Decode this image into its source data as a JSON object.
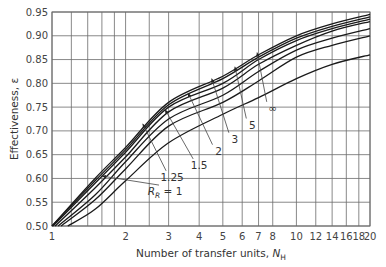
{
  "chart_data": {
    "type": "line",
    "title": "",
    "xlabel": "Number of transfer units, N_H",
    "xlabel_main": "Number of transfer units, ",
    "xlabel_symbol": "N",
    "xlabel_sub": "H",
    "ylabel": "Effectiveness, ε",
    "xscale": "log",
    "xlim": [
      1,
      20
    ],
    "ylim": [
      0.5,
      0.95
    ],
    "grid": true,
    "legend": "inline curve labels with leader arrows",
    "x_ticks": [
      1,
      2,
      3,
      4,
      5,
      6,
      7,
      8,
      10,
      12,
      14,
      16,
      18,
      20
    ],
    "x_tick_labels": [
      "1",
      "2",
      "3",
      "4",
      "5",
      "6",
      "7",
      "8",
      "10",
      "12",
      "14",
      "16",
      "18",
      "20"
    ],
    "x_minor_gridlines": [
      1.2,
      1.4,
      1.6,
      1.8,
      2.5
    ],
    "y_ticks": [
      0.5,
      0.55,
      0.6,
      0.65,
      0.7,
      0.75,
      0.8,
      0.85,
      0.9,
      0.95
    ],
    "y_tick_labels": [
      "0.50",
      "0.55",
      "0.60",
      "0.65",
      "0.70",
      "0.75",
      "0.80",
      "0.85",
      "0.90",
      "0.95"
    ],
    "x": [
      1,
      1.5,
      2,
      3,
      5,
      7,
      10,
      14,
      20
    ],
    "series": [
      {
        "name": "R_R = ∞",
        "label": "∞",
        "start_x": 1.0,
        "values": [
          0.5,
          0.6,
          0.665,
          0.76,
          0.815,
          0.86,
          0.9,
          0.925,
          0.945
        ]
      },
      {
        "name": "R_R = 5",
        "label": "5",
        "start_x": 1.0,
        "values": [
          0.5,
          0.595,
          0.66,
          0.755,
          0.81,
          0.855,
          0.895,
          0.92,
          0.94
        ]
      },
      {
        "name": "R_R = 3",
        "label": "3",
        "start_x": 1.01,
        "values": [
          0.5,
          0.59,
          0.655,
          0.75,
          0.8,
          0.85,
          0.89,
          0.915,
          0.935
        ]
      },
      {
        "name": "R_R = 2",
        "label": "2",
        "start_x": 1.03,
        "values": [
          0.5,
          0.58,
          0.645,
          0.74,
          0.79,
          0.84,
          0.88,
          0.91,
          0.93
        ]
      },
      {
        "name": "R_R = 1.5",
        "label": "1.5",
        "start_x": 1.06,
        "values": [
          0.5,
          0.565,
          0.635,
          0.725,
          0.775,
          0.825,
          0.87,
          0.895,
          0.915
        ]
      },
      {
        "name": "R_R = 1.25",
        "label": "1.25",
        "start_x": 1.09,
        "values": [
          0.5,
          0.555,
          0.62,
          0.71,
          0.76,
          0.805,
          0.855,
          0.88,
          0.9
        ]
      },
      {
        "name": "R_R = 1",
        "label": "R_R = 1",
        "start_x": 1.16,
        "values": [
          0.5,
          0.535,
          0.595,
          0.675,
          0.735,
          0.77,
          0.81,
          0.84,
          0.86
        ]
      }
    ],
    "annotations": [
      {
        "text": "R_R = 1",
        "text_x": 2.9,
        "text_y": 0.565,
        "arrow_to_x": 1.6,
        "arrow_to_y": 0.605
      },
      {
        "text": "1.25",
        "text_x": 3.1,
        "text_y": 0.595,
        "arrow_to_x": 2.35,
        "arrow_to_y": 0.715
      },
      {
        "text": "1.5",
        "text_x": 4.0,
        "text_y": 0.62,
        "arrow_to_x": 2.9,
        "arrow_to_y": 0.745
      },
      {
        "text": "2",
        "text_x": 4.8,
        "text_y": 0.65,
        "arrow_to_x": 3.6,
        "arrow_to_y": 0.78
      },
      {
        "text": "3",
        "text_x": 5.6,
        "text_y": 0.675,
        "arrow_to_x": 4.5,
        "arrow_to_y": 0.81
      },
      {
        "text": "5",
        "text_x": 6.6,
        "text_y": 0.705,
        "arrow_to_x": 5.6,
        "arrow_to_y": 0.835
      },
      {
        "text": "∞",
        "text_x": 8.0,
        "text_y": 0.74,
        "arrow_to_x": 6.9,
        "arrow_to_y": 0.865
      }
    ]
  },
  "labels": {
    "ylabel": "Effectiveness, ε",
    "xlabel_main": "Number of transfer units, ",
    "xlabel_symbol": "N",
    "xlabel_sub": "H",
    "rr_symbol": "R",
    "rr_sub": "R",
    "rr_eq": " = 1"
  },
  "colors": {
    "grid": "#6b6b6b",
    "curve": "#1a1a1a",
    "text": "#3a3a3a",
    "background": "#ffffff"
  }
}
